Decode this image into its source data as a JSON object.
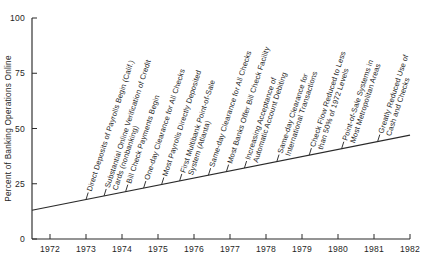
{
  "chart_data": {
    "type": "line",
    "title": "",
    "xlabel": "",
    "ylabel": "Percent of Banking Operations Online",
    "xlim": [
      1971.5,
      1982.0
    ],
    "ylim": [
      0,
      100
    ],
    "grid": false,
    "legend": "none",
    "x_ticks": [
      "1972",
      "1973",
      "1974",
      "1975",
      "1976",
      "1977",
      "1978",
      "1979",
      "1980",
      "1981",
      "1982"
    ],
    "y_ticks": [
      "0",
      "25",
      "50",
      "75",
      "100"
    ],
    "series": [
      {
        "name": "Percent of Banking Operations Online",
        "x": [
          1971.5,
          1982.0
        ],
        "values": [
          13,
          47
        ]
      }
    ],
    "annotations": [
      {
        "id": "a1",
        "x": 1973.0,
        "y": 20,
        "text": [
          "Direct Deposits of Payrolls Begin (Calif.)"
        ]
      },
      {
        "id": "a2",
        "x": 1973.5,
        "y": 22,
        "text": [
          "Substantial Online Verification of Credit",
          "Cards (nonbanking)"
        ]
      },
      {
        "id": "a3",
        "x": 1974.1,
        "y": 24,
        "text": [
          "Bill Check Payments Begin"
        ]
      },
      {
        "id": "a4",
        "x": 1974.6,
        "y": 25,
        "text": [
          "One-day Clearance for All Checks"
        ]
      },
      {
        "id": "a5",
        "x": 1975.1,
        "y": 27,
        "text": [
          "Most Payrolls Directly Deposited"
        ]
      },
      {
        "id": "a6",
        "x": 1975.6,
        "y": 28,
        "text": [
          "First Multibank Point-of-Sale",
          "System (Atlanta)"
        ]
      },
      {
        "id": "a7",
        "x": 1976.4,
        "y": 31,
        "text": [
          "Same-day Clearance for All Checks"
        ]
      },
      {
        "id": "a8",
        "x": 1976.9,
        "y": 32,
        "text": [
          "Most Banks Offer Bill Check Facility"
        ]
      },
      {
        "id": "a9",
        "x": 1977.4,
        "y": 34,
        "text": [
          "Increasing Acceptance of",
          "Automatic Account Debiting"
        ]
      },
      {
        "id": "a10",
        "x": 1978.3,
        "y": 37,
        "text": [
          "Same-day Clearance for",
          "International Transactions"
        ]
      },
      {
        "id": "a11",
        "x": 1979.2,
        "y": 39,
        "text": [
          "Check Flow Reduced to Less",
          "than 50% of 1972 Levels"
        ]
      },
      {
        "id": "a12",
        "x": 1980.1,
        "y": 42,
        "text": [
          "Point-of-Sale Systems in",
          "Most Metropolitan Areas"
        ]
      },
      {
        "id": "a13",
        "x": 1981.1,
        "y": 45,
        "text": [
          "Greatly Reduced Use of",
          "Cash and Checks"
        ]
      }
    ]
  },
  "colors": {
    "axis": "#2a2a2a",
    "line": "#2a2a2a",
    "text": "#1f1f1f",
    "background": "#ffffff"
  },
  "caption": {
    "text": ""
  }
}
